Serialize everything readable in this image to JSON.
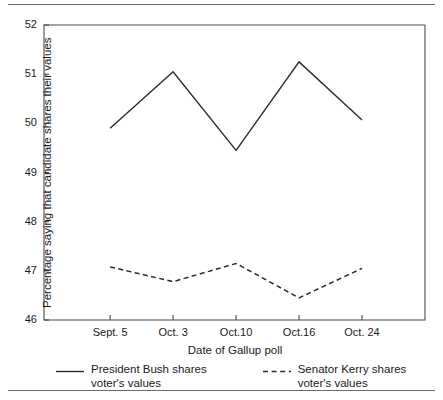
{
  "chart_data": {
    "type": "line",
    "title": "",
    "xlabel": "Date of Gallup poll",
    "ylabel": "Percentage saying that candidate shares their values",
    "categories": [
      "Sept. 5",
      "Oct. 3",
      "Oct.10",
      "Oct.16",
      "Oct. 24"
    ],
    "ylim": [
      46,
      52
    ],
    "yticks": [
      46,
      47,
      48,
      49,
      50,
      51,
      52
    ],
    "ytick_labels": [
      "46",
      "47",
      "48",
      "49",
      "50",
      "51",
      "52"
    ],
    "grid": false,
    "legend_position": "below-axis",
    "series": [
      {
        "name": "President Bush shares voter's values",
        "style": "solid",
        "color": "#2b2b2b",
        "values": [
          49.9,
          51.05,
          49.45,
          51.25,
          50.07
        ]
      },
      {
        "name": "Senator Kerry shares voter's values",
        "style": "dashed",
        "color": "#2b2b2b",
        "values": [
          47.08,
          46.78,
          47.15,
          46.45,
          47.05
        ]
      }
    ]
  },
  "legend": {
    "bush": {
      "label": "President Bush shares\nvoter's values",
      "sample": "solid-line-sample"
    },
    "kerry": {
      "label": "Senator Kerry shares\nvoter's values",
      "sample": "dashed-line-sample"
    }
  }
}
